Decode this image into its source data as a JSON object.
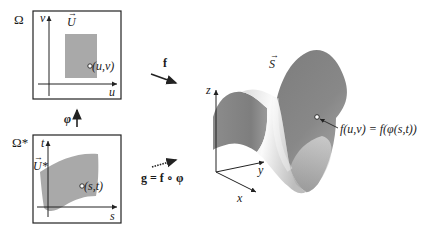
{
  "domain_box": {
    "label": "Ω",
    "axis_v": "v",
    "axis_u": "u",
    "region_label": "U",
    "point_label": "(u,v)"
  },
  "param_box": {
    "label": "Ω*",
    "axis_t": "t",
    "axis_s": "s",
    "region_label": "U*",
    "point_label": "(s,t)"
  },
  "arrows": {
    "phi_label": "φ",
    "f_label": "f",
    "g_label": "g = f ∘ φ"
  },
  "surface": {
    "label": "S",
    "point_label": "f(u,v) = f(φ(s,t))",
    "axis_x": "x",
    "axis_y": "y",
    "axis_z": "z"
  },
  "colors": {
    "region_fill": "#a9a9a9",
    "surface_dark": "#8a8a8a",
    "surface_light": "#f2f2f2",
    "stroke": "#222222"
  }
}
